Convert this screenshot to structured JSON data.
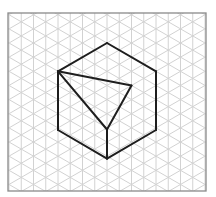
{
  "diagram": {
    "type": "isometric-grid-drawing",
    "colors": {
      "background": "#ffffff",
      "grid_line": "#d2d2d2",
      "frame": "#8a8a8a",
      "shape_line": "#1e1e1e"
    },
    "frame": {
      "x": 8,
      "y": 13,
      "width": 198,
      "height": 178
    },
    "grid": {
      "column_spacing": 12.25,
      "angle_deg": 30,
      "anchor": {
        "x": 58,
        "y": 71.3
      }
    },
    "vertices": {
      "top": {
        "x": 107,
        "y": 43
      },
      "left": {
        "x": 58,
        "y": 71.3
      },
      "right": {
        "x": 156,
        "y": 71.3
      },
      "bottom_left": {
        "x": 58,
        "y": 130
      },
      "bottom_right": {
        "x": 156,
        "y": 130
      },
      "bottom": {
        "x": 107,
        "y": 158.6
      },
      "cut_right": {
        "x": 131.5,
        "y": 85.5
      },
      "cut_front": {
        "x": 107,
        "y": 129.5
      }
    },
    "edges": [
      [
        "top",
        "right"
      ],
      [
        "right",
        "bottom_right"
      ],
      [
        "bottom_right",
        "bottom"
      ],
      [
        "bottom",
        "bottom_left"
      ],
      [
        "bottom_left",
        "left"
      ],
      [
        "left",
        "top"
      ],
      [
        "left",
        "cut_right"
      ],
      [
        "cut_right",
        "cut_front"
      ],
      [
        "left",
        "cut_front"
      ],
      [
        "cut_front",
        "bottom"
      ]
    ]
  }
}
